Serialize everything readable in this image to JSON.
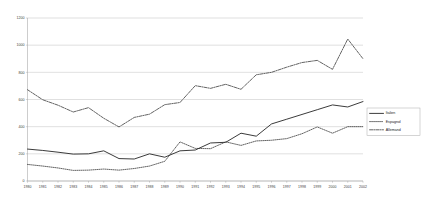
{
  "chart_data": {
    "type": "line",
    "title": "",
    "subtitle": "",
    "xlabel": "",
    "ylabel": "",
    "grid": "horizontal",
    "legend_position": "right",
    "xlim": [
      1980,
      2002
    ],
    "ylim": [
      0,
      1200
    ],
    "ytick_values": [
      0,
      200,
      400,
      600,
      800,
      1000,
      1200
    ],
    "ytick_labels": [
      "0",
      "200",
      "400",
      "600",
      "800",
      "1000",
      "1200"
    ],
    "categories": [
      "1980",
      "1981",
      "1982",
      "1983",
      "1984",
      "1985",
      "1986",
      "1987",
      "1988",
      "1989",
      "1990",
      "1991",
      "1992",
      "1993",
      "1994",
      "1995",
      "1996",
      "1997",
      "1998",
      "1999",
      "2000",
      "2001",
      "2002"
    ],
    "series": [
      {
        "name": "Italien",
        "style": "solid",
        "color": "#303030",
        "values": [
          235,
          225,
          212,
          198,
          200,
          222,
          165,
          162,
          200,
          175,
          222,
          228,
          280,
          285,
          352,
          330,
          420,
          455,
          490,
          525,
          560,
          545,
          585
        ]
      },
      {
        "name": "Espagnol",
        "style": "dotted",
        "color": "#303030",
        "values": [
          122,
          110,
          96,
          78,
          80,
          88,
          80,
          92,
          110,
          145,
          288,
          240,
          238,
          288,
          262,
          295,
          300,
          312,
          348,
          398,
          352,
          400,
          400
        ]
      },
      {
        "name": "Allemand",
        "style": "dash-dot",
        "color": "#303030",
        "values": [
          672,
          598,
          558,
          508,
          540,
          462,
          398,
          468,
          492,
          562,
          578,
          702,
          682,
          712,
          675,
          782,
          800,
          838,
          872,
          888,
          822,
          1045,
          900
        ]
      }
    ]
  },
  "legend": {
    "items": [
      {
        "label": "Italien"
      },
      {
        "label": "Espagnol"
      },
      {
        "label": "Allemand"
      }
    ]
  }
}
